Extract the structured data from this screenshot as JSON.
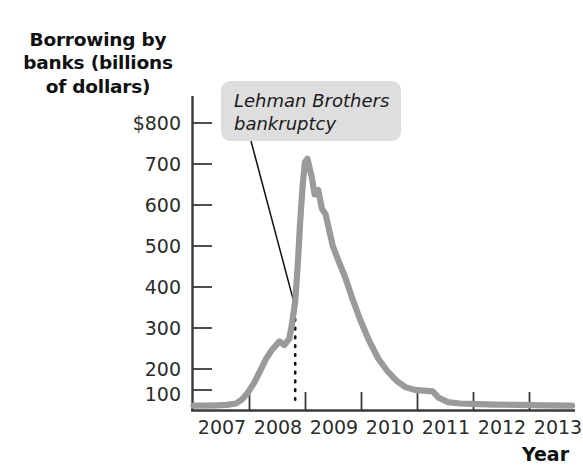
{
  "chart_data": {
    "type": "line",
    "title": "",
    "ylabel": "Borrowing by banks (billions of dollars)",
    "xlabel": "Year",
    "ylim": [
      0,
      800
    ],
    "xlim": [
      2007,
      2013.25
    ],
    "grid": false,
    "legend": "none",
    "y_ticks": [
      "$800",
      "700",
      "600",
      "500",
      "400",
      "300",
      "200",
      "100"
    ],
    "y_tick_values": [
      800,
      700,
      600,
      500,
      400,
      300,
      200,
      100
    ],
    "x_ticks": [
      "2007",
      "2008",
      "2009",
      "2010",
      "2011",
      "2012",
      "2013"
    ],
    "x_tick_values": [
      2007,
      2008,
      2009,
      2010,
      2011,
      2012,
      2013
    ],
    "series": [
      {
        "name": "Borrowing by banks",
        "color": "#9a9a9a",
        "x": [
          2007.0,
          2007.2,
          2007.4,
          2007.55,
          2007.7,
          2007.8,
          2007.9,
          2008.0,
          2008.1,
          2008.2,
          2008.3,
          2008.42,
          2008.5,
          2008.58,
          2008.62,
          2008.68,
          2008.72,
          2008.76,
          2008.8,
          2008.84,
          2008.88,
          2008.95,
          2009.0,
          2009.06,
          2009.12,
          2009.18,
          2009.24,
          2009.3,
          2009.38,
          2009.5,
          2009.62,
          2009.75,
          2009.9,
          2010.05,
          2010.2,
          2010.35,
          2010.5,
          2010.65,
          2010.8,
          2010.95,
          2011.05,
          2011.2,
          2011.4,
          2011.7,
          2012.0,
          2012.4,
          2012.8,
          2013.25
        ],
        "y": [
          8,
          8,
          9,
          10,
          14,
          25,
          45,
          72,
          105,
          140,
          165,
          188,
          178,
          195,
          230,
          300,
          400,
          520,
          620,
          690,
          700,
          650,
          600,
          612,
          560,
          545,
          500,
          455,
          420,
          370,
          310,
          250,
          190,
          140,
          105,
          78,
          60,
          52,
          50,
          48,
          30,
          18,
          14,
          12,
          11,
          10,
          9,
          8
        ],
        "peak": {
          "year": 2008.88,
          "value": 700
        },
        "secondary_peak": {
          "year": 2009.06,
          "value": 612
        }
      }
    ],
    "annotations": [
      {
        "name": "lehman-brothers-bankruptcy",
        "text": "Lehman Brothers\nbankruptcy",
        "marker_type": "dotted-vertical-line",
        "marker_year": 2008.68,
        "marker_value": 300,
        "box_color": "#dedede"
      }
    ]
  },
  "axis": {
    "y_title": "Borrowing by\nbanks (billions\nof dollars)",
    "x_title": "Year"
  },
  "colors": {
    "line": "#9a9a9a",
    "axis": "#3a3a3a",
    "text": "#2b2b2b",
    "annotation_box": "#dedede"
  }
}
